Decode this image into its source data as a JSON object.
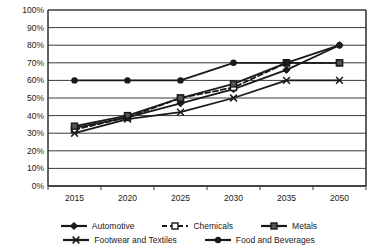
{
  "chart_data": {
    "type": "line",
    "title": "",
    "xlabel": "",
    "ylabel": "",
    "categories": [
      "2015",
      "2020",
      "2025",
      "2030",
      "2035",
      "2050"
    ],
    "ylim": [
      0,
      100
    ],
    "ytick_labels": [
      "0%",
      "10%",
      "20%",
      "30%",
      "40%",
      "50%",
      "60%",
      "70%",
      "80%",
      "90%",
      "100%"
    ],
    "ytick_values": [
      0,
      10,
      20,
      30,
      40,
      50,
      60,
      70,
      80,
      90,
      100
    ],
    "grid": true,
    "legend_position": "bottom",
    "series": [
      {
        "name": "Automotive",
        "values": [
          33,
          39,
          47,
          55,
          66,
          80
        ],
        "color": "#1a1a1a",
        "marker": "diamond",
        "marker_fill": "#1a1a1a",
        "dash": "none"
      },
      {
        "name": "Chemicals",
        "values": [
          32,
          39,
          50,
          56,
          70,
          70
        ],
        "color": "#1a1a1a",
        "marker": "square",
        "marker_fill": "#ffffff",
        "dash": "dashed"
      },
      {
        "name": "Metals",
        "values": [
          34,
          40,
          50,
          58,
          70,
          70
        ],
        "color": "#1a1a1a",
        "marker": "square",
        "marker_fill": "#555555",
        "dash": "none"
      },
      {
        "name": "Footwear and Textiles",
        "values": [
          30,
          38,
          42,
          50,
          60,
          60
        ],
        "color": "#1a1a1a",
        "marker": "cross",
        "marker_fill": "#1a1a1a",
        "dash": "none"
      },
      {
        "name": "Food and Beverages",
        "values": [
          60,
          60,
          60,
          70,
          70,
          80
        ],
        "color": "#1a1a1a",
        "marker": "dot",
        "marker_fill": "#1a1a1a",
        "dash": "none"
      }
    ],
    "legend_rows": [
      [
        "Automotive",
        "Chemicals",
        "Metals"
      ],
      [
        "Footwear and Textiles",
        "Food and Beverages"
      ]
    ]
  }
}
